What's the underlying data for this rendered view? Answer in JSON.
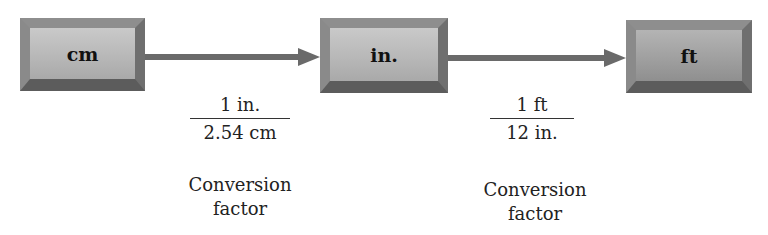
{
  "diagram": {
    "nodes": [
      {
        "id": "cm",
        "label": "cm"
      },
      {
        "id": "in",
        "label": "in."
      },
      {
        "id": "ft",
        "label": "ft"
      }
    ],
    "edges": [
      {
        "from": "cm",
        "to": "in",
        "numerator": "1 in.",
        "denominator": "2.54 cm",
        "caption_line1": "Conversion",
        "caption_line2": "factor"
      },
      {
        "from": "in",
        "to": "ft",
        "numerator": "1 ft",
        "denominator": "12 in.",
        "caption_line1": "Conversion",
        "caption_line2": "factor"
      }
    ]
  },
  "colors": {
    "box_fill": "#b8b8b8",
    "box_border": "#6e6e6e",
    "arrow": "#6a6a6a",
    "text": "#222222"
  }
}
